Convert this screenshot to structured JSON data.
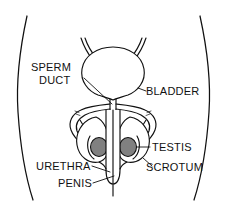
{
  "figure": {
    "background_color": "#ffffff",
    "line_color": "#111111",
    "testis_fill_color": "#808080"
  },
  "labels": {
    "sperm_duct_line1": "SPERM",
    "sperm_duct_line2": "DUCT",
    "bladder": "BLADDER",
    "testis": "TESTIS",
    "scrotum": "SCROTUM",
    "urethra": "URETHRA",
    "penis": "PENIS"
  },
  "parts": [
    {
      "name": "body-outline-left",
      "label": ""
    },
    {
      "name": "body-outline-right",
      "label": ""
    },
    {
      "name": "bladder",
      "label": "BLADDER"
    },
    {
      "name": "ureter-left",
      "label": ""
    },
    {
      "name": "ureter-right",
      "label": ""
    },
    {
      "name": "sperm-duct-left",
      "label": "SPERM DUCT"
    },
    {
      "name": "sperm-duct-right",
      "label": "SPERM DUCT"
    },
    {
      "name": "testis-left",
      "label": "TESTIS"
    },
    {
      "name": "testis-right",
      "label": "TESTIS"
    },
    {
      "name": "scrotum-left",
      "label": "SCROTUM"
    },
    {
      "name": "scrotum-right",
      "label": "SCROTUM"
    },
    {
      "name": "urethra",
      "label": "URETHRA"
    },
    {
      "name": "penis",
      "label": "PENIS"
    }
  ]
}
